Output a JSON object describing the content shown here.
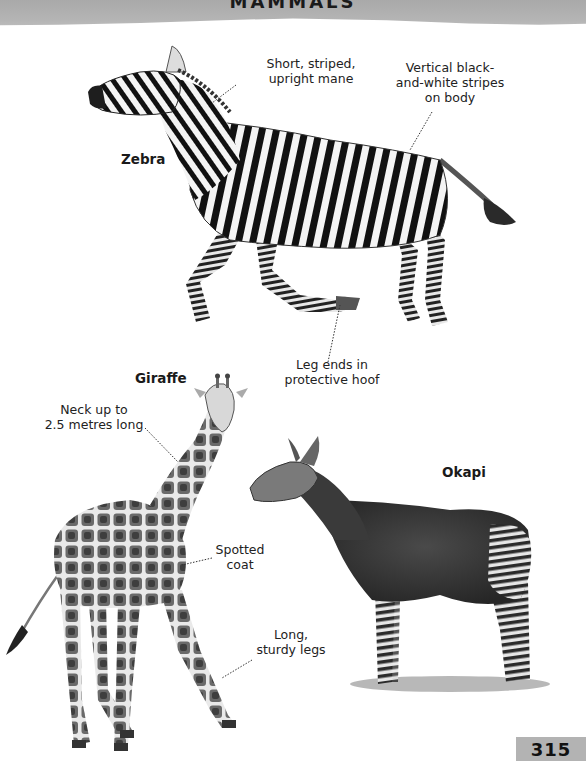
{
  "header": {
    "title": "MAMMALS"
  },
  "page": {
    "number": "315"
  },
  "colors": {
    "header_band": "#b0b0b0",
    "page_badge": "#b3b3b3",
    "text": "#1a1a1a"
  },
  "animals": {
    "zebra": {
      "name": "Zebra",
      "annotations": {
        "mane": "Short, striped,\nupright mane",
        "stripes": "Vertical black-\nand-white stripes\non body",
        "hoof": "Leg ends in\nprotective hoof"
      }
    },
    "giraffe": {
      "name": "Giraffe",
      "annotations": {
        "neck": "Neck up to\n2.5 metres long",
        "coat": "Spotted\ncoat",
        "legs": "Long,\nsturdy legs"
      }
    },
    "okapi": {
      "name": "Okapi"
    }
  }
}
